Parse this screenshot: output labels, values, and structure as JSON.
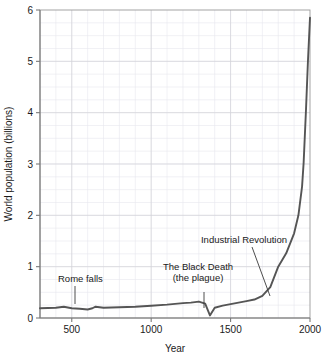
{
  "chart_data": {
    "type": "line",
    "title": "",
    "xlabel": "Year",
    "ylabel": "World population (billions)",
    "xlim": [
      300,
      2000
    ],
    "ylim": [
      0,
      6
    ],
    "grid": true,
    "legend": "none",
    "x_ticks": [
      "500",
      "1000",
      "1500",
      "2000"
    ],
    "x_tick_values": [
      500,
      1000,
      1500,
      2000
    ],
    "y_ticks": [
      "0",
      "1",
      "2",
      "3",
      "4",
      "5",
      "6"
    ],
    "y_tick_values": [
      0,
      1,
      2,
      3,
      4,
      5,
      6
    ],
    "x_minor_step": 100,
    "y_minor_step": 0.25,
    "series": [
      {
        "name": "World population",
        "color": "#555555",
        "x": [
          300,
          400,
          450,
          500,
          550,
          600,
          630,
          650,
          700,
          800,
          900,
          1000,
          1100,
          1200,
          1250,
          1300,
          1340,
          1370,
          1400,
          1450,
          1500,
          1550,
          1600,
          1650,
          1700,
          1750,
          1800,
          1850,
          1900,
          1927,
          1950,
          1960,
          1975,
          1987,
          2000
        ],
        "y": [
          0.19,
          0.2,
          0.22,
          0.19,
          0.18,
          0.165,
          0.19,
          0.22,
          0.2,
          0.21,
          0.22,
          0.24,
          0.26,
          0.29,
          0.3,
          0.32,
          0.28,
          0.05,
          0.2,
          0.24,
          0.27,
          0.3,
          0.33,
          0.36,
          0.43,
          0.6,
          1.0,
          1.26,
          1.65,
          2.0,
          2.56,
          3.03,
          4.07,
          5.0,
          5.85
        ]
      }
    ],
    "annotations": [
      {
        "name": "rome-falls",
        "lines": [
          "Rome falls"
        ],
        "text_x": 58,
        "text_y": 282,
        "anchor": "start",
        "leader": [
          [
            75,
            286
          ],
          [
            75,
            304
          ]
        ]
      },
      {
        "name": "black-death",
        "lines": [
          "The Black Death",
          "(the plague)"
        ],
        "text_x": 198,
        "text_y": 270,
        "anchor": "middle",
        "leader": [
          [
            204,
            292
          ],
          [
            204,
            308
          ]
        ]
      },
      {
        "name": "industrial-revolution",
        "lines": [
          "Industrial Revolution"
        ],
        "text_x": 244,
        "text_y": 243,
        "anchor": "middle",
        "leader": [
          [
            252,
            247
          ],
          [
            270,
            296
          ]
        ]
      }
    ]
  },
  "axes": {
    "y_axis_title": "World population (billions)",
    "x_axis_title": "Year"
  }
}
